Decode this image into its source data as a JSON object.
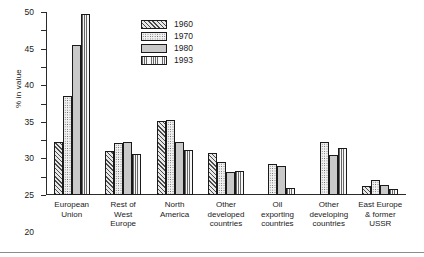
{
  "chart_data": {
    "type": "bar",
    "title": "",
    "xlabel": "",
    "ylabel": "% in value",
    "ylim": [
      0,
      50
    ],
    "ytick_step": 5,
    "yticks": [
      "0",
      "5",
      "10",
      "15",
      "20",
      "25",
      "30",
      "35",
      "40",
      "45",
      "50"
    ],
    "grid": false,
    "legend_position": "top-center",
    "categories": [
      "European\nUnion",
      "Rest of\nWest\nEurope",
      "North\nAmerica",
      "Other\ndeveloped\ncountries",
      "Oil\nexporting\ncountries",
      "Other\ndeveloping\ncountries",
      "East Europe\n& former\nUSSR"
    ],
    "category_labels": [
      [
        "European",
        "Union"
      ],
      [
        "Rest of",
        "West",
        "Europe"
      ],
      [
        "North",
        "America"
      ],
      [
        "Other",
        "developed",
        "countries"
      ],
      [
        "Oil",
        "exporting",
        "countries"
      ],
      [
        "Other",
        "developing",
        "countries"
      ],
      [
        "East Europe",
        "& former",
        "USSR"
      ]
    ],
    "series": [
      {
        "name": "1960",
        "pattern": "diagonal-hatch",
        "values": [
          14.5,
          12.0,
          20.2,
          11.5,
          null,
          null,
          2.5
        ]
      },
      {
        "name": "1970",
        "pattern": "dotted",
        "values": [
          27.0,
          14.3,
          20.4,
          9.0,
          8.5,
          14.5,
          4.0
        ]
      },
      {
        "name": "1980",
        "pattern": "solid-gray",
        "values": [
          41.0,
          14.5,
          14.5,
          6.2,
          7.8,
          11.0,
          2.7
        ]
      },
      {
        "name": "1993",
        "pattern": "vertical-lines",
        "values": [
          49.5,
          11.3,
          12.4,
          6.6,
          1.8,
          12.8,
          1.6
        ]
      }
    ]
  },
  "legend": {
    "items": [
      {
        "label": "1960"
      },
      {
        "label": "1970"
      },
      {
        "label": "1980"
      },
      {
        "label": "1993"
      }
    ]
  },
  "colors": {
    "axis": "#2a2a2a",
    "text": "#1a1a1a",
    "bar_1960": "#d8d8d8",
    "bar_1970": "#f0f0f0",
    "bar_1980": "#c9c9c9",
    "bar_1993": "#f2f2f2"
  }
}
